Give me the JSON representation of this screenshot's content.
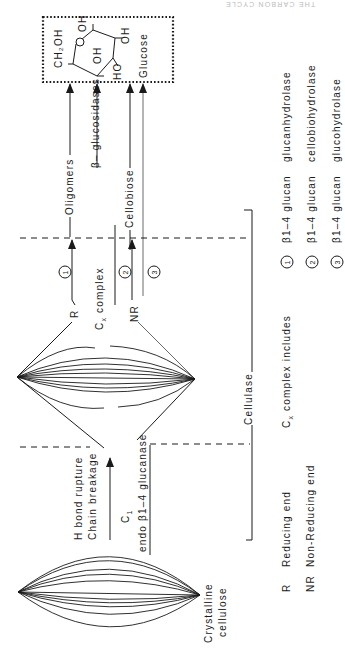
{
  "header": {
    "running_title": "THE CARBON CYCLE"
  },
  "product_box": {
    "title": "Glucose",
    "structure": {
      "ch2oh": "CH₂OH",
      "oh1": "OH",
      "oh2": "OH",
      "oh3": "OH",
      "ho": "HO"
    }
  },
  "products": {
    "oligomers": "Oligomers",
    "beta_glucosidases": "β– glucosidases",
    "cellobiose": "Cellobiose"
  },
  "ends": {
    "reducing": "R",
    "non_reducing": "NR"
  },
  "steps": {
    "one": "1",
    "two": "2",
    "three": "3"
  },
  "cx": {
    "label": "C",
    "subscript": "x",
    "suffix": " complex"
  },
  "c1": {
    "label": "C",
    "subscript": "1",
    "enzyme": "endo β1–4 glucanase",
    "action_line1": "H bond rupture",
    "action_line2": "Chain breakage"
  },
  "bracket": {
    "label": "Cellulase"
  },
  "substrate": {
    "line1": "Crystalline",
    "line2": "cellulose"
  },
  "legend": {
    "abbreviations": [
      {
        "key": "R",
        "value": "Reducing end"
      },
      {
        "key": "NR",
        "value": "Non-Reducing end"
      }
    ],
    "cx_includes": {
      "prefix": "C",
      "subscript": "x",
      "text": " complex includes"
    },
    "enzymes": [
      {
        "num": "1",
        "bond": "β1–4 glucan",
        "name": "glucanhydrolase"
      },
      {
        "num": "2",
        "bond": "β1–4 glucan",
        "name": "cellobiohydrolase"
      },
      {
        "num": "3",
        "bond": "β1–4 glucan",
        "name": "glucohydrolase"
      }
    ]
  }
}
